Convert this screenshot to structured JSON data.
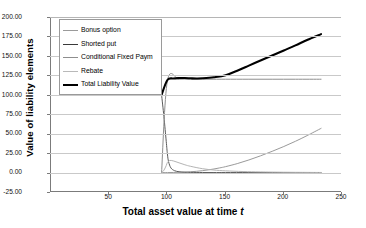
{
  "chart_data": {
    "type": "line",
    "title": "",
    "xlabel": "Total asset value at time t",
    "xlabel_plain": "Total asset value at time ",
    "xlabel_italic": "t",
    "ylabel": "Value of liability elements",
    "xlim": [
      0,
      250
    ],
    "ylim": [
      -25.0,
      200.0
    ],
    "grid": true,
    "legend_position": "upper-left-inside",
    "xticks": [
      "50",
      "100",
      "150",
      "200",
      "250"
    ],
    "xtick_values": [
      50,
      100,
      150,
      200,
      250
    ],
    "yticks": [
      "-25.00",
      "0.00",
      "25.00",
      "50.00",
      "75.00",
      "100.00",
      "125.00",
      "150.00",
      "175.00",
      "200.00"
    ],
    "ytick_values": [
      -25.0,
      0.0,
      25.0,
      50.0,
      75.0,
      100.0,
      125.0,
      150.0,
      175.0,
      200.0
    ],
    "series": [
      {
        "name": "Bonus option",
        "color": "#9a9a9a",
        "width": 1.0,
        "x": [
          95,
          100,
          105,
          110,
          115,
          120,
          125,
          130,
          135,
          140,
          145,
          150,
          160,
          170,
          180,
          190,
          200,
          210,
          220,
          232
        ],
        "values": [
          0.0,
          0.0,
          0.1,
          0.3,
          0.6,
          1.0,
          1.6,
          2.4,
          3.4,
          4.6,
          6.0,
          7.6,
          11.5,
          16.2,
          21.5,
          27.3,
          33.5,
          40.2,
          47.5,
          56.8
        ]
      },
      {
        "name": "Shorted put",
        "color": "#5a5a5a",
        "width": 1.0,
        "x": [
          95,
          97,
          99,
          100,
          101,
          103,
          106,
          110,
          115,
          120,
          130,
          140,
          150,
          170,
          190,
          210,
          232
        ],
        "values": [
          100.0,
          72.0,
          40.0,
          24.0,
          14.0,
          6.0,
          2.5,
          1.0,
          0.4,
          0.2,
          0.05,
          0.0,
          0.0,
          0.0,
          0.0,
          0.0,
          0.0
        ]
      },
      {
        "name": "Conditional Fixed Paym",
        "color": "#8e8e8e",
        "width": 1.0,
        "x": [
          95,
          100,
          110,
          120,
          130,
          140,
          150,
          170,
          190,
          210,
          232
        ],
        "values": [
          0.0,
          118.0,
          120.0,
          120.0,
          120.0,
          120.0,
          120.0,
          120.0,
          120.0,
          120.0,
          120.0
        ]
      },
      {
        "name": "Rebate",
        "color": "#b4b4b4",
        "width": 1.0,
        "x": [
          95,
          97,
          99,
          100,
          102,
          105,
          110,
          115,
          120,
          130,
          140,
          150,
          165,
          180,
          200,
          232
        ],
        "values": [
          0.0,
          3.0,
          9.0,
          13.0,
          15.5,
          15.0,
          12.5,
          10.0,
          8.0,
          5.0,
          3.2,
          2.2,
          1.3,
          0.8,
          0.4,
          0.1
        ]
      },
      {
        "name": "Total Liability Value",
        "color": "#000000",
        "width": 2.1,
        "x": [
          95,
          100,
          105,
          110,
          115,
          120,
          125,
          130,
          140,
          150,
          160,
          170,
          180,
          190,
          200,
          210,
          220,
          232
        ],
        "values": [
          100.0,
          119.0,
          121.0,
          121.5,
          121.5,
          121.2,
          121.0,
          121.2,
          122.5,
          125.0,
          131.0,
          137.5,
          144.0,
          150.5,
          157.0,
          163.5,
          170.5,
          178.0
        ]
      }
    ],
    "legend": [
      {
        "label": "Bonus option",
        "color": "#9a9a9a",
        "width": 1.4
      },
      {
        "label": "Shorted put",
        "color": "#3a3a3a",
        "width": 1.7
      },
      {
        "label": "Conditional Fixed Paym",
        "color": "#8e8e8e",
        "width": 1.3
      },
      {
        "label": "Rebate",
        "color": "#b9b9b9",
        "width": 1.3
      },
      {
        "label": "Total Liability Value",
        "color": "#000000",
        "width": 2.4
      }
    ]
  }
}
